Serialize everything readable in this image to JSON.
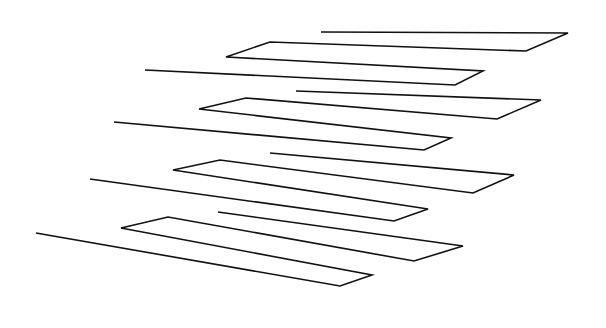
{
  "figure": {
    "title": "",
    "width": 606,
    "height": 328,
    "background": "#ffffff",
    "stroke_color": "#111111",
    "stroke_width": 1.6
  },
  "ribbons": [
    {
      "name": "ribbon-1",
      "points": [
        [
          321,
          32
        ],
        [
          568,
          33
        ],
        [
          526,
          51
        ],
        [
          270,
          42
        ],
        [
          226,
          57
        ],
        [
          483,
          71
        ],
        [
          455,
          85
        ],
        [
          145,
          70
        ]
      ]
    },
    {
      "name": "ribbon-2",
      "points": [
        [
          296,
          91
        ],
        [
          541,
          100
        ],
        [
          497,
          119
        ],
        [
          246,
          98
        ],
        [
          199,
          109
        ],
        [
          451,
          138
        ],
        [
          424,
          150
        ],
        [
          114,
          122
        ]
      ]
    },
    {
      "name": "ribbon-3",
      "points": [
        [
          270,
          153
        ],
        [
          514,
          175
        ],
        [
          473,
          193
        ],
        [
          220,
          160
        ],
        [
          173,
          170
        ],
        [
          428,
          209
        ],
        [
          394,
          221
        ],
        [
          90,
          179
        ]
      ]
    },
    {
      "name": "ribbon-4",
      "points": [
        [
          218,
          212
        ],
        [
          463,
          246
        ],
        [
          414,
          261
        ],
        [
          168,
          217
        ],
        [
          121,
          228
        ],
        [
          372,
          275
        ],
        [
          340,
          286
        ],
        [
          36,
          233
        ]
      ]
    }
  ]
}
